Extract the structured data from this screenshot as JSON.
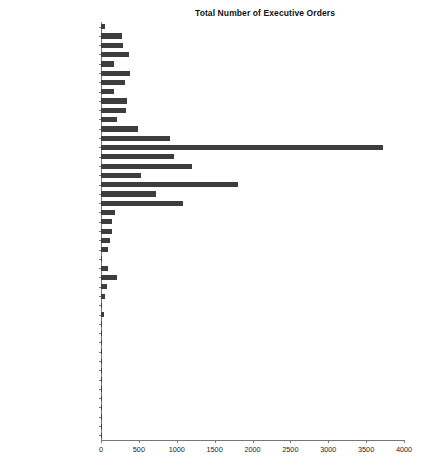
{
  "chart": {
    "title": "Total Number of Executive Orders",
    "type": "bar",
    "orientation": "horizontal"
  },
  "axis": {
    "x_ticks": [
      "0",
      "500",
      "1000",
      "1500",
      "2000",
      "2500",
      "3000",
      "3500",
      "4000"
    ],
    "x_min": 0,
    "x_max": 4000,
    "x_label": "",
    "y_label": "",
    "grid": false,
    "legend": "none"
  },
  "style": {
    "bar_color": "#3d3d3d",
    "axis_color": "#777777",
    "text_color": "#1c1c1c",
    "background": "#ffffff"
  },
  "chart_data": {
    "type": "bar",
    "orientation": "horizontal",
    "title": "Total Number of Executive Orders",
    "xlabel": "",
    "ylabel": "",
    "xlim": [
      0,
      4000
    ],
    "xticks": [
      0,
      500,
      1000,
      1500,
      2000,
      2500,
      3000,
      3500,
      4000
    ],
    "grid": false,
    "legend_position": "none",
    "categories": [
      "Donald J. Trump",
      "Barack Obama",
      "George W. Bush",
      "William J. Clinton",
      "George H. W. Bush",
      "Ronald Reagan",
      "Jimmy Carter",
      "Gerald R. Ford",
      "Richard Nixon",
      "Lyndon B. Johnson",
      "John F. Kennedy",
      "Dwight D. Eisenhower",
      "Harry S. Truman",
      "Franklin D. Roosevelt",
      "Herbert Hoover",
      "Calvin Coolidge",
      "Warren G. Harding",
      "Woodrow Wilson",
      "William Howard Taft",
      "Theodore Roosevelt",
      "William McKinley",
      "Grover Cleveland - II",
      "Benjamin Harrison",
      "Grover Cleveland - I",
      "Chester Arthur",
      "James Garfield",
      "Rutherford B. Hayes",
      "Ulysses S. Grant",
      "Andrew Johnson",
      "Abraham Lincoln",
      "James Buchanan",
      "Franklin Pierce",
      "Millard Fillmore",
      "Zachary Taylor",
      "James K. Polk",
      "John Tyler",
      "William Henry Harrison",
      "Martin Van Buren",
      "Andrew Jackson",
      "John Quincy Adams",
      "James Monroe",
      "James Madison",
      "Thomas Jefferson",
      "John Adams",
      "George Washington"
    ],
    "values": [
      55,
      277,
      291,
      364,
      166,
      381,
      320,
      169,
      346,
      325,
      214,
      484,
      907,
      3721,
      968,
      1203,
      522,
      1803,
      724,
      1081,
      185,
      140,
      143,
      113,
      96,
      6,
      92,
      217,
      79,
      48,
      16,
      35,
      12,
      5,
      18,
      17,
      0,
      10,
      12,
      3,
      1,
      1,
      4,
      1,
      8
    ]
  }
}
